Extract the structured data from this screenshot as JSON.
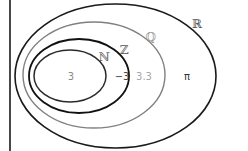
{
  "diagram": {
    "type": "venn-nested",
    "frame": {
      "left_border_x": 10,
      "color": "#1a1a1a"
    },
    "sets": [
      {
        "id": "reals",
        "label": "ℝ",
        "cx": 115.5,
        "cy": 76,
        "rx": 100.5,
        "ry": 72,
        "stroke": "#1a1a1a",
        "stroke_width": 1.6,
        "label_x": 197,
        "label_y": 28,
        "label_color": "#555555"
      },
      {
        "id": "rationals",
        "label": "ℚ",
        "cx": 94,
        "cy": 75,
        "rx": 71,
        "ry": 53,
        "stroke": "#808080",
        "stroke_width": 1.4,
        "label_x": 151,
        "label_y": 41,
        "label_color": "#9a9a9a"
      },
      {
        "id": "integers",
        "label": "ℤ",
        "cx": 79,
        "cy": 76,
        "rx": 50,
        "ry": 37,
        "stroke": "#111111",
        "stroke_width": 1.8,
        "label_x": 124,
        "label_y": 54,
        "label_color": "#555555"
      },
      {
        "id": "naturals",
        "label": "ℕ",
        "cx": 70,
        "cy": 76,
        "rx": 36,
        "ry": 26,
        "stroke": "#2b2b2b",
        "stroke_width": 1.5,
        "label_x": 104,
        "label_y": 61,
        "label_color": "#666666"
      }
    ],
    "elements": [
      {
        "value": "3",
        "x": 71,
        "y": 80,
        "color": "#8a8a8a",
        "set": "naturals"
      },
      {
        "value": "−3",
        "x": 122,
        "y": 80,
        "color": "#444444",
        "set": "integers"
      },
      {
        "value": "3.3",
        "x": 144,
        "y": 80,
        "color": "#a8a8a8",
        "set": "rationals"
      },
      {
        "value": "π",
        "x": 187,
        "y": 80,
        "color": "#333333",
        "set": "reals"
      }
    ]
  }
}
